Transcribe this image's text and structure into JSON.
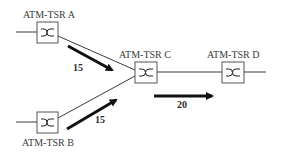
{
  "diagram": {
    "nodes": [
      {
        "id": "A",
        "label": "ATM-TSR A"
      },
      {
        "id": "B",
        "label": "ATM-TSR B"
      },
      {
        "id": "C",
        "label": "ATM-TSR C"
      },
      {
        "id": "D",
        "label": "ATM-TSR D"
      }
    ],
    "flows": [
      {
        "from": "A",
        "to": "C",
        "value": "15"
      },
      {
        "from": "B",
        "to": "C",
        "value": "15"
      },
      {
        "from": "C",
        "to": "D",
        "value": "20"
      }
    ],
    "colors": {
      "line": "#3a3a3a",
      "arrow": "#111111",
      "box_border": "#555555"
    }
  }
}
